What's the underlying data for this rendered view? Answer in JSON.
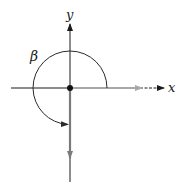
{
  "diagram": {
    "type": "angle-in-standard-position",
    "labels": {
      "x_axis": "x",
      "y_axis": "y",
      "angle": "β"
    },
    "angle_description": "Angle β measured counterclockwise from positive x-axis to negative y-axis (270°)",
    "elements": {
      "initial_side": "positive x-axis (gray vector)",
      "terminal_side": "negative y-axis (gray vector)",
      "vertex": "origin"
    },
    "colors": {
      "axis": "#1a1a1a",
      "vector": "#a8a8a8",
      "terminal_vector": "#7a7a7a",
      "arc": "#2a2a2a",
      "background": "#ffffff"
    }
  }
}
